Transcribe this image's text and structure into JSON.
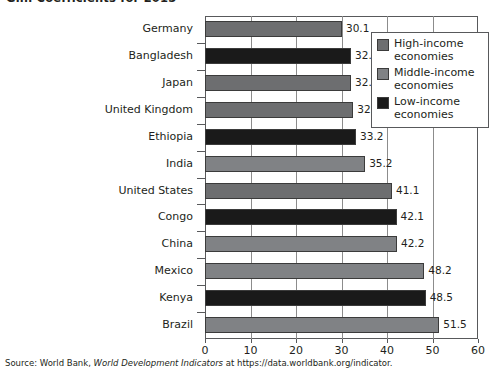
{
  "chart_title": "Gini Coefficients for 2015",
  "source_note": {
    "prefix": "Source: World Bank, ",
    "italic_title": "World Development Indicators",
    "suffix": " at https://data.worldbank.org/indicator."
  },
  "legend": {
    "items": [
      {
        "label_line1": "High-income",
        "label_line2": "economies",
        "color": "#6d6e70"
      },
      {
        "label_line1": "Middle-income",
        "label_line2": "economies",
        "color": "#808285"
      },
      {
        "label_line1": "Low-income",
        "label_line2": "economies",
        "color": "#1a1a1a"
      }
    ]
  },
  "chart_data": {
    "type": "bar",
    "orientation": "horizontal",
    "title": "Gini Coefficients for 2015",
    "xlabel": "",
    "ylabel": "",
    "xlim": [
      0,
      60
    ],
    "xticks": [
      0,
      10,
      20,
      30,
      40,
      50,
      60
    ],
    "grid": true,
    "grid_axis": "x",
    "legend_position": "top-right",
    "categories": [
      "Germany",
      "Bangladesh",
      "Japan",
      "United Kingdom",
      "Ethiopia",
      "India",
      "United States",
      "Congo",
      "China",
      "Mexico",
      "Kenya",
      "Brazil"
    ],
    "values": [
      30.1,
      32.1,
      32.1,
      32.6,
      33.2,
      35.2,
      41.1,
      42.1,
      42.2,
      48.2,
      48.5,
      51.5
    ],
    "groups": [
      "High-income economies",
      "Low-income economies",
      "High-income economies",
      "High-income economies",
      "Low-income economies",
      "Middle-income economies",
      "High-income economies",
      "Low-income economies",
      "Middle-income economies",
      "Middle-income economies",
      "Low-income economies",
      "Middle-income economies"
    ],
    "bar_colors": [
      "#6d6e70",
      "#1a1a1a",
      "#6d6e70",
      "#6d6e70",
      "#1a1a1a",
      "#808285",
      "#6d6e70",
      "#1a1a1a",
      "#808285",
      "#808285",
      "#1a1a1a",
      "#808285"
    ],
    "data_labels": [
      "30.1",
      "32.1",
      "32.1",
      "32.6",
      "33.2",
      "35.2",
      "41.1",
      "42.1",
      "42.2",
      "48.2",
      "48.5",
      "51.5"
    ],
    "xtick_labels": [
      "0",
      "10",
      "20",
      "30",
      "40",
      "50",
      "60"
    ]
  }
}
